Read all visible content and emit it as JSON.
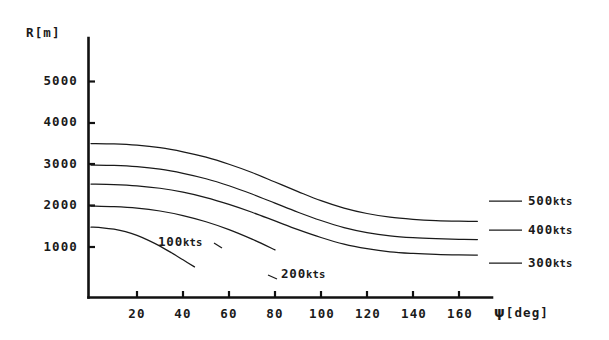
{
  "chart_data": {
    "type": "line",
    "title": "",
    "xlabel": "ψ [deg]",
    "ylabel": "R[m]",
    "xlabel_symbol": "ψ",
    "xlabel_unit": "[deg]",
    "ylabel_text": "R[m]",
    "xlim": [
      0,
      170
    ],
    "ylim": [
      0,
      5600
    ],
    "grid": false,
    "legend_position": "inline-curve-labels",
    "xticks": [
      20,
      40,
      60,
      80,
      100,
      120,
      140,
      160
    ],
    "xtick_labels": [
      "20",
      "40",
      "60",
      "80",
      "100",
      "120",
      "140",
      "160"
    ],
    "yticks": [
      1000,
      2000,
      3000,
      4000,
      5000
    ],
    "ytick_labels": [
      "1000",
      "2000",
      "3000",
      "4000",
      "5000"
    ],
    "series": [
      {
        "name": "500kts",
        "label_value": "500",
        "label_unit": "kts",
        "x": [
          0,
          10,
          20,
          30,
          40,
          50,
          60,
          70,
          80,
          90,
          100,
          110,
          120,
          130,
          140,
          150,
          160,
          168
        ],
        "y": [
          3500,
          3490,
          3460,
          3400,
          3300,
          3170,
          3000,
          2800,
          2570,
          2340,
          2120,
          1940,
          1810,
          1720,
          1670,
          1640,
          1625,
          1620
        ]
      },
      {
        "name": "400kts",
        "label_value": "400",
        "label_unit": "kts",
        "x": [
          0,
          10,
          20,
          30,
          40,
          50,
          60,
          70,
          80,
          90,
          100,
          110,
          120,
          130,
          140,
          150,
          160,
          168
        ],
        "y": [
          2980,
          2970,
          2940,
          2880,
          2780,
          2650,
          2480,
          2280,
          2060,
          1840,
          1640,
          1470,
          1350,
          1270,
          1225,
          1200,
          1185,
          1180
        ]
      },
      {
        "name": "300kts",
        "label_value": "300",
        "label_unit": "kts",
        "x": [
          0,
          10,
          20,
          30,
          40,
          50,
          60,
          70,
          80,
          90,
          100,
          110,
          120,
          130,
          140,
          150,
          160,
          168
        ],
        "y": [
          2520,
          2510,
          2480,
          2420,
          2325,
          2195,
          2030,
          1840,
          1630,
          1420,
          1230,
          1070,
          960,
          885,
          845,
          820,
          808,
          805
        ]
      },
      {
        "name": "200kts",
        "label_value": "200",
        "label_unit": "kts",
        "x": [
          0,
          10,
          20,
          30,
          40,
          50,
          60,
          70,
          80
        ],
        "y": [
          1990,
          1975,
          1940,
          1870,
          1760,
          1610,
          1420,
          1190,
          930
        ]
      },
      {
        "name": "100kts",
        "label_value": "100",
        "label_unit": "kts",
        "x": [
          0,
          5,
          10,
          15,
          20,
          25,
          30,
          35,
          40,
          45
        ],
        "y": [
          1480,
          1465,
          1430,
          1370,
          1280,
          1160,
          1020,
          860,
          690,
          520
        ]
      }
    ],
    "curve_labels": [
      {
        "text": "100kts",
        "value": "100",
        "unit": "kts"
      },
      {
        "text": "200kts",
        "value": "200",
        "unit": "kts"
      },
      {
        "text": "300kts",
        "value": "300",
        "unit": "kts"
      },
      {
        "text": "400kts",
        "value": "400",
        "unit": "kts"
      },
      {
        "text": "500kts",
        "value": "500",
        "unit": "kts"
      }
    ]
  },
  "axes": {
    "y_axis_title": "R[m]",
    "x_axis_title_symbol": "ψ",
    "x_axis_title_unit": "[deg]"
  },
  "ticks": {
    "y": [
      "5000",
      "4000",
      "3000",
      "2000",
      "1000"
    ],
    "x": [
      "20",
      "40",
      "60",
      "80",
      "100",
      "120",
      "140",
      "160"
    ]
  },
  "labels": {
    "s100_value": "100",
    "s100_unit": "kts",
    "s200_value": "200",
    "s200_unit": "kts",
    "s300_value": "300",
    "s300_unit": "kts",
    "s400_value": "400",
    "s400_unit": "kts",
    "s500_value": "500",
    "s500_unit": "kts"
  },
  "colors": {
    "ink": "#111111",
    "curve": "#1a1a1a",
    "background": "#ffffff"
  }
}
